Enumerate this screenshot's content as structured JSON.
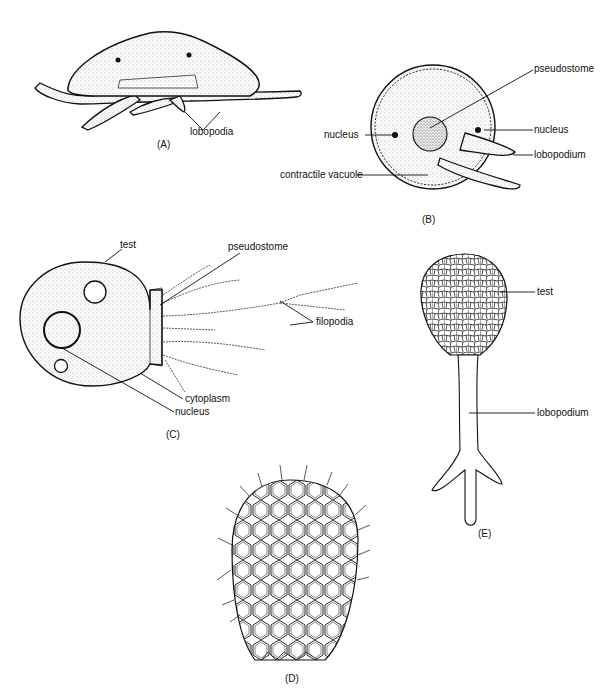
{
  "figure": {
    "panels": [
      {
        "id": "A",
        "label": "(A)",
        "labels": [
          "lobopodia"
        ]
      },
      {
        "id": "B",
        "label": "(B)",
        "labels": [
          "pseudostome",
          "nucleus",
          "nucleus",
          "lobopodium",
          "contractile vacuole"
        ]
      },
      {
        "id": "C",
        "label": "(C)",
        "labels": [
          "test",
          "pseudostome",
          "filopodia",
          "cytoplasm",
          "nucleus"
        ]
      },
      {
        "id": "D",
        "label": "(D)",
        "labels": []
      },
      {
        "id": "E",
        "label": "(E)",
        "labels": [
          "test",
          "lobopodium"
        ]
      }
    ]
  },
  "colors": {
    "ink": "#111111",
    "stipple": "#d9d9d9",
    "background": "#ffffff"
  }
}
